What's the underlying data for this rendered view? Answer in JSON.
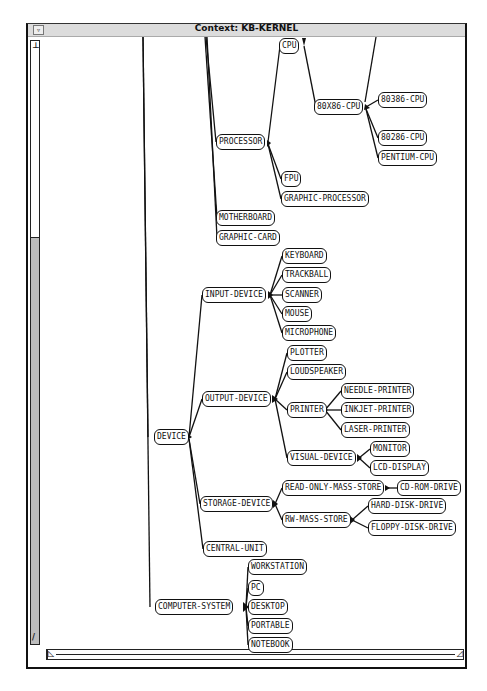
{
  "window": {
    "title": "Context: KB-KERNEL",
    "menu_button": "▿",
    "vscroll_top_arrow": "⊥",
    "vscroll_bottom_arrow": "/",
    "hscroll_left_arrow": "◺",
    "hscroll_right_arrow": "◿"
  },
  "colors": {
    "edge": "#111111",
    "node_border": "#111111",
    "titlebar": "#dcdcdc",
    "scroll_track": "#bdbdbd"
  },
  "nodes": {
    "cpu": "CPU",
    "x86cpu": "80X86-CPU",
    "cpu80386": "80386-CPU",
    "cpu80286": "80286-CPU",
    "pentium": "PENTIUM-CPU",
    "processor": "PROCESSOR",
    "fpu": "FPU",
    "graphic_processor": "GRAPHIC-PROCESSOR",
    "motherboard": "MOTHERBOARD",
    "graphic_card": "GRAPHIC-CARD",
    "input_device": "INPUT-DEVICE",
    "keyboard": "KEYBOARD",
    "trackball": "TRACKBALL",
    "scanner": "SCANNER",
    "mouse": "MOUSE",
    "microphone": "MICROPHONE",
    "device": "DEVICE",
    "output_device": "OUTPUT-DEVICE",
    "plotter": "PLOTTER",
    "loudspeaker": "LOUDSPEAKER",
    "printer": "PRINTER",
    "needle_printer": "NEEDLE-PRINTER",
    "inkjet_printer": "INKJET-PRINTER",
    "laser_printer": "LASER-PRINTER",
    "visual_device": "VISUAL-DEVICE",
    "monitor": "MONITOR",
    "lcd_display": "LCD-DISPLAY",
    "storage_device": "STORAGE-DEVICE",
    "read_only_mass_store": "READ-ONLY-MASS-STORE",
    "cd_rom_drive": "CD-ROM-DRIVE",
    "rw_mass_store": "RW-MASS-STORE",
    "hard_disk_drive": "HARD-DISK-DRIVE",
    "floppy_disk_drive": "FLOPPY-DISK-DRIVE",
    "central_unit": "CENTRAL-UNIT",
    "computer_system": "COMPUTER-SYSTEM",
    "workstation": "WORKSTATION",
    "pc": "PC",
    "desktop": "DESKTOP",
    "portable": "PORTABLE",
    "notebook": "NOTEBOOK"
  }
}
